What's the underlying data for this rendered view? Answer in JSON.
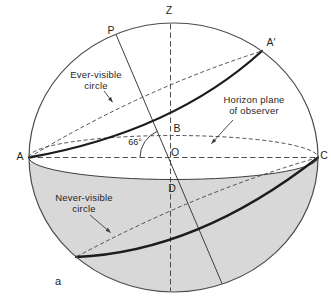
{
  "figure": {
    "type": "celestial-sphere-diagram",
    "caption_letter": "a",
    "angle_label": "66°",
    "point_labels": {
      "zenith": "Z",
      "celestial_pole": "P",
      "a_prime": "A′",
      "a": "A",
      "b": "B",
      "center": "O",
      "c": "C",
      "d": "D"
    },
    "annotations": {
      "ever_visible_circle": {
        "line1": "Ever-visible",
        "line2": "circle"
      },
      "horizon_plane": {
        "line1": "Horizon plane",
        "line2": "of observer"
      },
      "never_visible_circle": {
        "line1": "Never-visible",
        "line2": "circle"
      }
    },
    "colors": {
      "background": "#ffffff",
      "line": "#3d3d3d",
      "bold_line": "#1c1c1c",
      "shading": "#d8d8d8",
      "text": "#1f1f1f"
    }
  }
}
